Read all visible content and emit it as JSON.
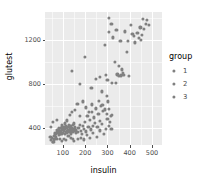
{
  "chart_data": {
    "type": "scatter",
    "title": "",
    "xlabel": "insulin",
    "ylabel": "glutest",
    "xlim": [
      20,
      545
    ],
    "ylim": [
      245,
      1450
    ],
    "xticks": [
      100,
      200,
      300,
      400,
      500
    ],
    "yticks": [
      400,
      800,
      1200
    ],
    "xminor": [
      50,
      150,
      250,
      350,
      450
    ],
    "yminor": [
      200,
      600,
      1000,
      1400
    ],
    "grid": true,
    "legend": {
      "title": "group",
      "position": "right",
      "entries": [
        "1",
        "2",
        "3"
      ]
    },
    "point_color": "#808080",
    "panel_background": "#EBEBEB",
    "grid_color": "#FFFFFF",
    "series": [
      {
        "name": "all",
        "points": [
          [
            55,
            270
          ],
          [
            60,
            295
          ],
          [
            62,
            330
          ],
          [
            66,
            350
          ],
          [
            68,
            315
          ],
          [
            70,
            345
          ],
          [
            72,
            360
          ],
          [
            74,
            300
          ],
          [
            76,
            380
          ],
          [
            78,
            352
          ],
          [
            80,
            368
          ],
          [
            82,
            338
          ],
          [
            84,
            395
          ],
          [
            86,
            372
          ],
          [
            88,
            348
          ],
          [
            90,
            400
          ],
          [
            92,
            365
          ],
          [
            94,
            342
          ],
          [
            96,
            386
          ],
          [
            98,
            412
          ],
          [
            100,
            358
          ],
          [
            102,
            392
          ],
          [
            104,
            370
          ],
          [
            106,
            405
          ],
          [
            108,
            345
          ],
          [
            110,
            388
          ],
          [
            112,
            420
          ],
          [
            114,
            362
          ],
          [
            116,
            398
          ],
          [
            118,
            376
          ],
          [
            120,
            355
          ],
          [
            122,
            408
          ],
          [
            124,
            382
          ],
          [
            126,
            430
          ],
          [
            128,
            365
          ],
          [
            130,
            395
          ],
          [
            132,
            372
          ],
          [
            134,
            415
          ],
          [
            136,
            388
          ],
          [
            138,
            350
          ],
          [
            140,
            402
          ],
          [
            142,
            378
          ],
          [
            144,
            425
          ],
          [
            146,
            360
          ],
          [
            148,
            392
          ],
          [
            150,
            440
          ],
          [
            152,
            370
          ],
          [
            155,
            405
          ],
          [
            158,
            385
          ],
          [
            160,
            352
          ],
          [
            44,
            320
          ],
          [
            48,
            288
          ],
          [
            52,
            310
          ],
          [
            58,
            272
          ],
          [
            64,
            298
          ],
          [
            46,
            412
          ],
          [
            56,
            455
          ],
          [
            72,
            470
          ],
          [
            88,
            300
          ],
          [
            95,
            282
          ],
          [
            105,
            300
          ],
          [
            115,
            292
          ],
          [
            125,
            330
          ],
          [
            135,
            310
          ],
          [
            145,
            298
          ],
          [
            150,
            282
          ],
          [
            165,
            362
          ],
          [
            170,
            398
          ],
          [
            175,
            430
          ],
          [
            180,
            372
          ],
          [
            185,
            345
          ],
          [
            190,
            415
          ],
          [
            195,
            392
          ],
          [
            200,
            452
          ],
          [
            205,
            368
          ],
          [
            210,
            512
          ],
          [
            215,
            408
          ],
          [
            220,
            472
          ],
          [
            225,
            386
          ],
          [
            230,
            545
          ],
          [
            235,
            420
          ],
          [
            240,
            495
          ],
          [
            245,
            442
          ],
          [
            250,
            580
          ],
          [
            255,
            412
          ],
          [
            260,
            528
          ],
          [
            265,
            462
          ],
          [
            270,
            602
          ],
          [
            275,
            438
          ],
          [
            280,
            555
          ],
          [
            168,
            300
          ],
          [
            182,
            312
          ],
          [
            196,
            296
          ],
          [
            208,
            335
          ],
          [
            222,
            308
          ],
          [
            236,
            355
          ],
          [
            252,
            320
          ],
          [
            268,
            378
          ],
          [
            284,
            345
          ],
          [
            292,
            392
          ],
          [
            155,
            560
          ],
          [
            165,
            620
          ],
          [
            178,
            505
          ],
          [
            190,
            640
          ],
          [
            205,
            585
          ],
          [
            218,
            545
          ],
          [
            232,
            612
          ],
          [
            248,
            572
          ],
          [
            262,
            648
          ],
          [
            278,
            605
          ],
          [
            288,
            568
          ],
          [
            296,
            530
          ],
          [
            302,
            640
          ],
          [
            308,
            575
          ],
          [
            315,
            505
          ],
          [
            300,
            480
          ],
          [
            312,
            452
          ],
          [
            322,
            520
          ],
          [
            305,
            418
          ],
          [
            318,
            388
          ],
          [
            130,
            515
          ],
          [
            142,
            548
          ],
          [
            120,
            468
          ],
          [
            108,
            440
          ],
          [
            96,
            425
          ],
          [
            142,
            915
          ],
          [
            175,
            795
          ],
          [
            198,
            1040
          ],
          [
            228,
            760
          ],
          [
            248,
            845
          ],
          [
            268,
            860
          ],
          [
            275,
            730
          ],
          [
            295,
            880
          ],
          [
            290,
            1150
          ],
          [
            298,
            690
          ],
          [
            305,
            1395
          ],
          [
            308,
            1270
          ],
          [
            318,
            1345
          ],
          [
            325,
            1220
          ],
          [
            332,
            1000
          ],
          [
            340,
            1285
          ],
          [
            345,
            885
          ],
          [
            352,
            870
          ],
          [
            358,
            1190
          ],
          [
            365,
            930
          ],
          [
            368,
            895
          ],
          [
            372,
            880
          ],
          [
            378,
            1275
          ],
          [
            388,
            1085
          ],
          [
            398,
            870
          ],
          [
            405,
            1330
          ],
          [
            418,
            1235
          ],
          [
            425,
            1175
          ],
          [
            435,
            1260
          ],
          [
            442,
            1215
          ],
          [
            448,
            1310
          ],
          [
            452,
            1195
          ],
          [
            458,
            1385
          ],
          [
            465,
            1295
          ],
          [
            472,
            1345
          ],
          [
            478,
            1375
          ],
          [
            485,
            1330
          ],
          [
            300,
            835
          ],
          [
            322,
            810
          ],
          [
            338,
            805
          ],
          [
            350,
            960
          ],
          [
            362,
            875
          ],
          [
            392,
            1190
          ],
          [
            412,
            1250
          ],
          [
            455,
            1240
          ]
        ]
      }
    ]
  }
}
